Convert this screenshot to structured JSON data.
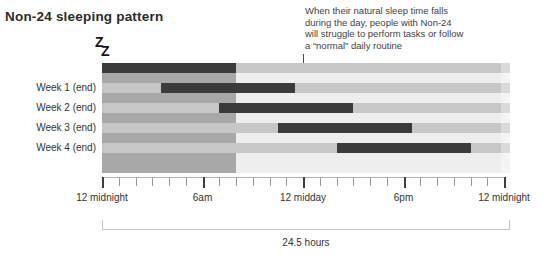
{
  "title": "Non-24 sleeping pattern",
  "sleep_icon": {
    "glyphs": [
      "Z",
      "Z"
    ]
  },
  "annotation": {
    "lines": [
      "When their natural sleep time falls",
      "during the day, people with Non-24",
      "will struggle to perform tasks or follow",
      "a “normal” daily routine"
    ]
  },
  "chart_data": {
    "type": "bar",
    "subtype": "horizontal-range-bars",
    "title": "Non-24 sleeping pattern",
    "rows": [
      {
        "label": "",
        "sleep_start_hour": 0,
        "sleep_end_hour": 8
      },
      {
        "label": "Week 1 (end)",
        "sleep_start_hour": 3.5,
        "sleep_end_hour": 11.5
      },
      {
        "label": "Week 2 (end)",
        "sleep_start_hour": 7,
        "sleep_end_hour": 15
      },
      {
        "label": "Week 3 (end)",
        "sleep_start_hour": 10.5,
        "sleep_end_hour": 18.5
      },
      {
        "label": "Week 4 (end)",
        "sleep_start_hour": 14,
        "sleep_end_hour": 22
      }
    ],
    "x_axis": {
      "range_hours": [
        0,
        24
      ],
      "tick_every_hours": 1,
      "major_tick_every_hours": 6,
      "labels": [
        {
          "hour": 0,
          "text": "12 midnight"
        },
        {
          "hour": 6,
          "text": "6am"
        },
        {
          "hour": 12,
          "text": "12 midday"
        },
        {
          "hour": 18,
          "text": "6pm"
        },
        {
          "hour": 24,
          "text": "12 midnight"
        }
      ]
    },
    "night_region_hours": [
      0,
      8
    ],
    "span_hours": 24.5,
    "span_label": "24.5 hours",
    "legend": "none",
    "grid": "off",
    "colors": {
      "bar": "#3b3b3b",
      "night_bg": "#a8a8a8",
      "day_bg": "#eeeeee",
      "track": "#c7c7c7",
      "ruler_line": "#b5b5b5",
      "minor_tick": "#9a9a9a",
      "major_tick": "#3f3f3f",
      "bracket": "#c6c6c6"
    }
  }
}
